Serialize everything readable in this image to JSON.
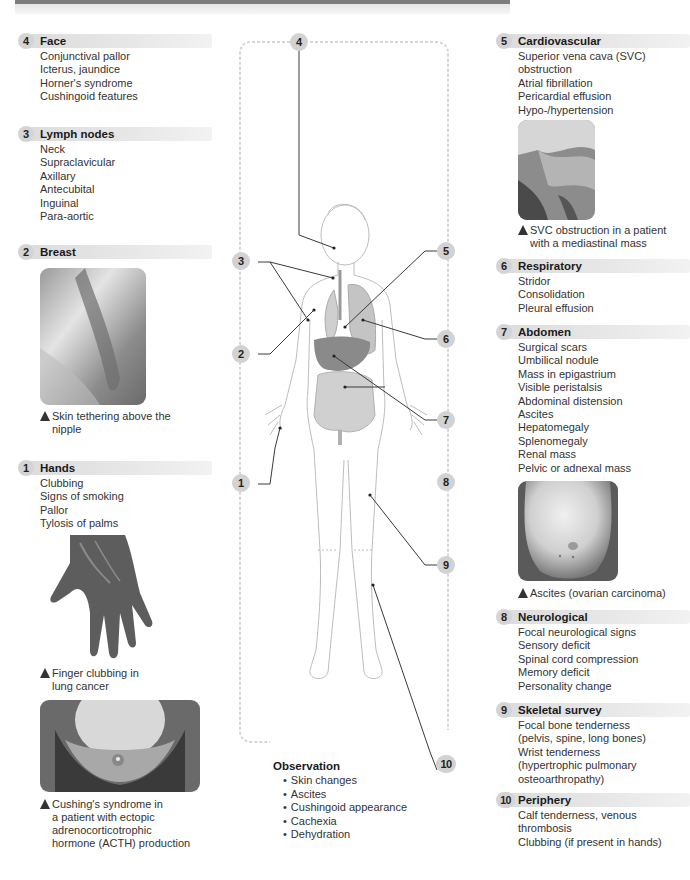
{
  "sections": {
    "face": {
      "number": "4",
      "title": "Face",
      "items": [
        "Conjunctival pallor",
        "Icterus, jaundice",
        "Horner's syndrome",
        "Cushingoid features"
      ]
    },
    "lymph": {
      "number": "3",
      "title": "Lymph nodes",
      "items": [
        "Neck",
        "Supraclavicular",
        "Axillary",
        "Antecubital",
        "Inguinal",
        "Para-aortic"
      ]
    },
    "breast": {
      "number": "2",
      "title": "Breast",
      "items": [],
      "caption": "Skin tethering above the nipple"
    },
    "hands": {
      "number": "1",
      "title": "Hands",
      "items": [
        "Clubbing",
        "Signs of smoking",
        "Pallor",
        "Tylosis of palms"
      ],
      "caption": "Finger clubbing in lung cancer",
      "caption2": "Cushing's syndrome in a patient with ectopic adrenocorticotrophic hormone (ACTH) production"
    },
    "cardio": {
      "number": "5",
      "title": "Cardiovascular",
      "items": [
        "Superior vena cava (SVC) obstruction",
        "Atrial fibrillation",
        "Pericardial effusion",
        "Hypo-/hypertension"
      ],
      "caption": "SVC obstruction in a patient with a mediastinal mass"
    },
    "resp": {
      "number": "6",
      "title": "Respiratory",
      "items": [
        "Stridor",
        "Consolidation",
        "Pleural effusion"
      ]
    },
    "abdomen": {
      "number": "7",
      "title": "Abdomen",
      "items": [
        "Surgical scars",
        "Umbilical nodule",
        "Mass in epigastrium",
        "Visible peristalsis",
        "Abdominal distension",
        "Ascites",
        "Hepatomegaly",
        "Splenomegaly",
        "Renal mass",
        "Pelvic or adnexal mass"
      ],
      "caption": "Ascites (ovarian carcinoma)"
    },
    "neuro": {
      "number": "8",
      "title": "Neurological",
      "items": [
        "Focal neurological signs",
        "Sensory deficit",
        "Spinal cord compression",
        "Memory deficit",
        "Personality change"
      ]
    },
    "skeletal": {
      "number": "9",
      "title": "Skeletal survey",
      "items": [
        "Focal bone tenderness",
        "(pelvis, spine, long bones)",
        "Wrist tenderness",
        "(hypertrophic pulmonary",
        "osteoarthropathy)"
      ]
    },
    "periphery": {
      "number": "10",
      "title": "Periphery",
      "items": [
        "Calf tenderness, venous",
        "thrombosis",
        "Clubbing (if present in hands)"
      ]
    }
  },
  "diagram": {
    "callouts": [
      "4",
      "3",
      "2",
      "1",
      "5",
      "6",
      "7",
      "8",
      "9",
      "10"
    ]
  },
  "observation": {
    "title": "Observation",
    "items": [
      "Skin changes",
      "Ascites",
      "Cushingoid appearance",
      "Cachexia",
      "Dehydration"
    ]
  },
  "captions_split": {
    "breast": [
      "Skin tethering above the",
      "nipple"
    ],
    "hands": [
      "Finger clubbing in",
      "lung cancer"
    ],
    "cushing": [
      "Cushing's syndrome in",
      "a patient with ectopic",
      "adrenocorticotrophic",
      "hormone (ACTH) production"
    ],
    "cardio": [
      "SVC obstruction in a patient",
      "with a mediastinal mass"
    ],
    "abdomen": [
      "Ascites (ovarian carcinoma)"
    ]
  },
  "colors": {
    "badge": "#d2d2d2",
    "header_bar": "#e2e2e2",
    "text": "#333333",
    "top_bar": "#7d7d7d"
  }
}
